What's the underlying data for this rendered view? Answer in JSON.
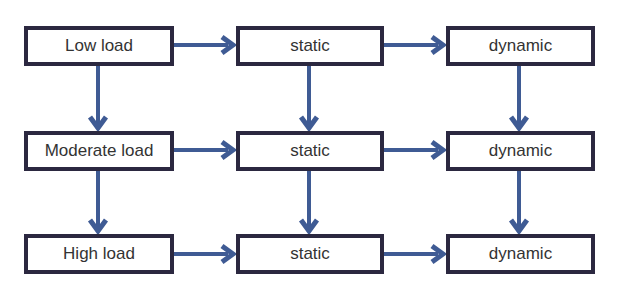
{
  "diagram": {
    "type": "flowchart-grid",
    "colors": {
      "box_border": "#2b2840",
      "arrow": "#3f5b94",
      "text": "#333333",
      "background": "#ffffff"
    },
    "nodes": [
      {
        "id": "low",
        "label": "Low load",
        "x": 24,
        "y": 26,
        "w": 150,
        "h": 40
      },
      {
        "id": "low-static",
        "label": "static",
        "x": 236,
        "y": 26,
        "w": 148,
        "h": 40
      },
      {
        "id": "low-dynamic",
        "label": "dynamic",
        "x": 446,
        "y": 26,
        "w": 149,
        "h": 40
      },
      {
        "id": "moderate",
        "label": "Moderate load",
        "x": 24,
        "y": 131,
        "w": 150,
        "h": 40
      },
      {
        "id": "moderate-static",
        "label": "static",
        "x": 236,
        "y": 131,
        "w": 148,
        "h": 40
      },
      {
        "id": "moderate-dynamic",
        "label": "dynamic",
        "x": 446,
        "y": 131,
        "w": 149,
        "h": 40
      },
      {
        "id": "high",
        "label": "High load",
        "x": 24,
        "y": 234,
        "w": 150,
        "h": 40
      },
      {
        "id": "high-static",
        "label": "static",
        "x": 236,
        "y": 234,
        "w": 148,
        "h": 40
      },
      {
        "id": "high-dynamic",
        "label": "dynamic",
        "x": 446,
        "y": 234,
        "w": 149,
        "h": 40
      }
    ],
    "edges": [
      {
        "from": "low",
        "to": "low-static"
      },
      {
        "from": "low-static",
        "to": "low-dynamic"
      },
      {
        "from": "moderate",
        "to": "moderate-static"
      },
      {
        "from": "moderate-static",
        "to": "moderate-dynamic"
      },
      {
        "from": "high",
        "to": "high-static"
      },
      {
        "from": "high-static",
        "to": "high-dynamic"
      },
      {
        "from": "low",
        "to": "moderate"
      },
      {
        "from": "moderate",
        "to": "high"
      },
      {
        "from": "low-static",
        "to": "moderate-static"
      },
      {
        "from": "moderate-static",
        "to": "high-static"
      },
      {
        "from": "low-dynamic",
        "to": "moderate-dynamic"
      },
      {
        "from": "moderate-dynamic",
        "to": "high-dynamic"
      }
    ]
  }
}
